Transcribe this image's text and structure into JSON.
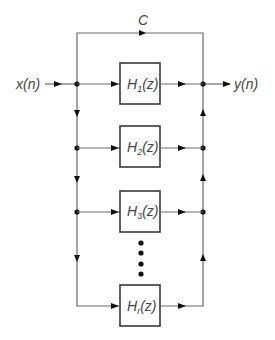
{
  "diagram": {
    "type": "parallel-form filter block diagram",
    "input_label": "x(n)",
    "output_label": "y(n)",
    "bypass_label": "C",
    "blocks": [
      {
        "name": "H",
        "sub": "1",
        "arg": "(z)"
      },
      {
        "name": "H",
        "sub": "2",
        "arg": "(z)"
      },
      {
        "name": "H",
        "sub": "3",
        "arg": "(z)"
      },
      {
        "name": "H",
        "sub": "r",
        "arg": "(z)"
      }
    ],
    "ellipsis_dots": 4,
    "colors": {
      "wire": "#6a6a6a",
      "box_border": "#3a3a3a",
      "node": "#111111",
      "text": "#444444",
      "background": "#ffffff"
    }
  }
}
